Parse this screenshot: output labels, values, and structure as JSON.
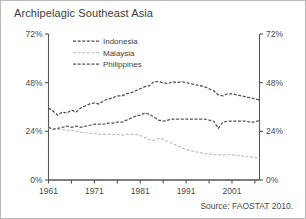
{
  "title": "Archipelagic Southeast Asia",
  "source_note": "Source: FAOSTAT 2010.",
  "axes": {
    "left_ticks": [
      "0%",
      "24%",
      "48%",
      "72%"
    ],
    "right_ticks": [
      "0%",
      "24%",
      "48%",
      "72%"
    ],
    "x_ticks": [
      "1961",
      "1971",
      "1981",
      "1991",
      "2001"
    ]
  },
  "legend": {
    "items": [
      {
        "label": "Indonesia",
        "color": "#4d4d4d",
        "dash": "3,1.6"
      },
      {
        "label": "Malaysia",
        "color": "#c3c3c3",
        "dash": "3,1.6"
      },
      {
        "label": "Philippines",
        "color": "#545454",
        "dash": "3,1.6"
      }
    ]
  },
  "chart_data": {
    "type": "line",
    "title": "Archipelagic Southeast Asia",
    "xlabel": "",
    "ylabel": "",
    "xlim": [
      1961,
      2007
    ],
    "ylim": [
      0,
      72
    ],
    "ytick_values": [
      0,
      24,
      48,
      72
    ],
    "xtick_values": [
      1961,
      1971,
      1981,
      1991,
      2001
    ],
    "grid": false,
    "legend_position": "top-left-inside",
    "x": [
      1961,
      1962,
      1963,
      1964,
      1965,
      1966,
      1967,
      1968,
      1969,
      1970,
      1971,
      1972,
      1973,
      1974,
      1975,
      1976,
      1977,
      1978,
      1979,
      1980,
      1981,
      1982,
      1983,
      1984,
      1985,
      1986,
      1987,
      1988,
      1989,
      1990,
      1991,
      1992,
      1993,
      1994,
      1995,
      1996,
      1997,
      1998,
      1999,
      2000,
      2001,
      2002,
      2003,
      2004,
      2005,
      2006,
      2007
    ],
    "series": [
      {
        "name": "Indonesia",
        "color": "#4d4d4d",
        "values": [
          35.5,
          34.0,
          32.0,
          33.5,
          33.0,
          34.5,
          33.5,
          35.5,
          36.5,
          37.5,
          38.0,
          37.5,
          39.0,
          40.0,
          40.5,
          41.5,
          41.5,
          42.5,
          43.0,
          44.0,
          45.0,
          46.0,
          46.5,
          48.5,
          48.5,
          48.0,
          47.5,
          48.5,
          48.0,
          48.5,
          48.0,
          47.5,
          47.0,
          46.5,
          46.0,
          45.0,
          44.0,
          42.0,
          41.5,
          42.5,
          42.5,
          42.0,
          41.5,
          41.0,
          40.5,
          40.0,
          39.5
        ]
      },
      {
        "name": "Malaysia",
        "color": "#c3c3c3",
        "values": [
          25.5,
          25.5,
          25.0,
          25.0,
          24.5,
          24.5,
          24.0,
          23.5,
          23.5,
          23.0,
          23.0,
          22.5,
          22.5,
          22.5,
          22.5,
          22.5,
          22.0,
          22.5,
          22.5,
          22.5,
          22.0,
          21.0,
          20.0,
          19.5,
          20.5,
          20.0,
          19.0,
          18.0,
          17.0,
          16.0,
          15.0,
          14.5,
          14.0,
          13.5,
          13.0,
          13.0,
          12.5,
          12.5,
          12.5,
          12.5,
          12.5,
          12.0,
          12.0,
          11.5,
          11.5,
          11.0,
          11.0
        ]
      },
      {
        "name": "Philippines",
        "color": "#545454",
        "values": [
          26.0,
          25.0,
          25.5,
          26.0,
          26.5,
          26.0,
          26.5,
          26.0,
          26.5,
          27.0,
          27.5,
          27.5,
          27.5,
          28.0,
          28.0,
          28.5,
          28.5,
          29.5,
          30.5,
          31.5,
          32.0,
          33.0,
          32.5,
          31.0,
          29.5,
          29.0,
          29.5,
          30.0,
          30.0,
          30.0,
          30.0,
          30.0,
          30.0,
          30.0,
          30.0,
          29.5,
          29.0,
          25.5,
          28.5,
          29.0,
          29.0,
          29.0,
          29.0,
          29.0,
          28.5,
          28.5,
          29.5
        ]
      }
    ]
  }
}
